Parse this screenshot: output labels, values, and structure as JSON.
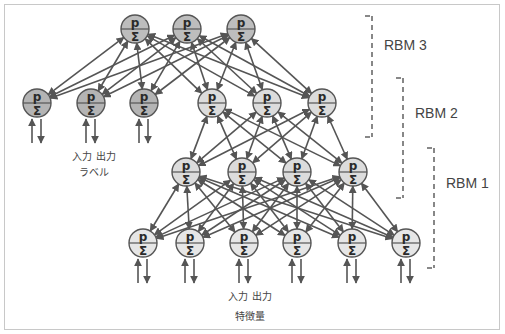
{
  "diagram": {
    "type": "deep-belief-network",
    "node_symbols": {
      "top": "p",
      "bottom": "Σ"
    },
    "colors": {
      "edge": "#555555",
      "label_node_fill": "#b4b4b4",
      "top_node_fill": "#bdbdbd",
      "hidden_node_fill": "#dcdcdc",
      "visible_node_fill": "#e6e6e6"
    },
    "layers": [
      {
        "id": "top",
        "nodes": [
          [
            135,
            29
          ],
          [
            187,
            29
          ],
          [
            241,
            29
          ]
        ],
        "fill": "top"
      },
      {
        "id": "label",
        "nodes": [
          [
            37,
            103
          ],
          [
            91,
            103
          ],
          [
            144,
            103
          ]
        ],
        "fill": "label",
        "io_arrows": true
      },
      {
        "id": "hidden2",
        "nodes": [
          [
            212,
            103
          ],
          [
            267,
            103
          ],
          [
            322,
            103
          ]
        ],
        "fill": "hidden"
      },
      {
        "id": "hidden1",
        "nodes": [
          [
            186,
            172
          ],
          [
            242,
            172
          ],
          [
            297,
            172
          ],
          [
            353,
            172
          ]
        ],
        "fill": "hidden"
      },
      {
        "id": "visible",
        "nodes": [
          [
            143,
            243
          ],
          [
            190,
            243
          ],
          [
            244,
            243
          ],
          [
            297,
            243
          ],
          [
            352,
            243
          ],
          [
            406,
            243
          ]
        ],
        "fill": "visible",
        "io_arrows": true
      }
    ],
    "connections": [
      {
        "from": "label",
        "to": "top"
      },
      {
        "from": "hidden2",
        "to": "top"
      },
      {
        "from": "hidden1",
        "to": "hidden2"
      },
      {
        "from": "visible",
        "to": "hidden1"
      }
    ],
    "brackets": [
      {
        "label": "RBM 3",
        "x": 372,
        "y1": 16,
        "y2": 137,
        "label_x": 384,
        "label_y": 50
      },
      {
        "label": "RBM 2",
        "x": 403,
        "y1": 78,
        "y2": 198,
        "label_x": 415,
        "label_y": 118
      },
      {
        "label": "RBM 1",
        "x": 434,
        "y1": 148,
        "y2": 268,
        "label_x": 446,
        "label_y": 188
      }
    ],
    "captions": {
      "label_io": "入力 出力",
      "label_name": "ラベル",
      "feature_io": "入力 出力",
      "feature_name": "特徴量"
    }
  }
}
